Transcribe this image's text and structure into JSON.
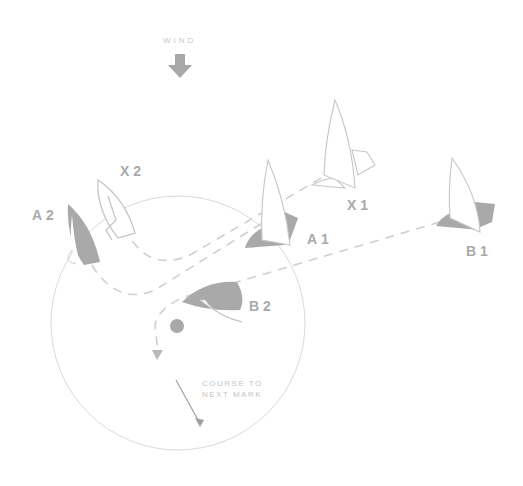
{
  "wind": {
    "label": "WIND",
    "arrow_color": "#a8a8a8"
  },
  "boats": [
    {
      "id": "A2",
      "label": "A2"
    },
    {
      "id": "X2",
      "label": "X2"
    },
    {
      "id": "X1",
      "label": "X1"
    },
    {
      "id": "A1",
      "label": "A1"
    },
    {
      "id": "B1",
      "label": "B1"
    },
    {
      "id": "B2",
      "label": "B2"
    }
  ],
  "course": {
    "line1": "COURSE TO",
    "line2": "NEXT MARK"
  },
  "colors": {
    "hull": "#a9a9a9",
    "line": "#cfcfcf",
    "circle": "#d8d8d8"
  }
}
